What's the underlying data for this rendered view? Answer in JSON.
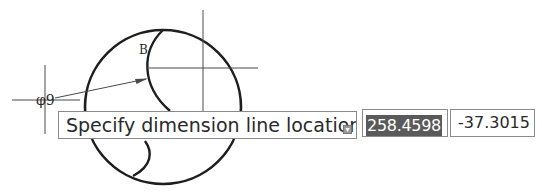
{
  "drawing": {
    "dimension_label": "φ9",
    "point_label": "B",
    "colors": {
      "geometry": "#1e1e1e",
      "construction_lines": "#4a4a4a"
    }
  },
  "dynamic_input": {
    "prompt": "Specify dimension line location or",
    "expand_icon": "down-arrow-icon",
    "x_value": "258.4598",
    "y_value": "-37.3015",
    "highlight_color": "#5a5a5a"
  }
}
